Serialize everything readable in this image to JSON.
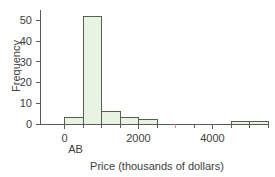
{
  "chart_data": {
    "type": "bar",
    "title": "",
    "subtitle": "",
    "xlabel": "Price (thousands of dollars)",
    "ylabel": "Frequency",
    "xlim": [
      -500,
      5500
    ],
    "ylim": [
      0,
      55
    ],
    "grid": false,
    "legend": null,
    "bin_width": 500,
    "categories": [
      "-500",
      "0",
      "500",
      "1000",
      "1500",
      "2000",
      "2500",
      "3000",
      "3500",
      "4000",
      "4500",
      "5000"
    ],
    "bins": [
      {
        "start": -500,
        "end": 0,
        "value": 0
      },
      {
        "start": 0,
        "end": 500,
        "value": 3
      },
      {
        "start": 500,
        "end": 1000,
        "value": 52
      },
      {
        "start": 1000,
        "end": 1500,
        "value": 6
      },
      {
        "start": 1500,
        "end": 2000,
        "value": 3
      },
      {
        "start": 2000,
        "end": 2500,
        "value": 2
      },
      {
        "start": 2500,
        "end": 3000,
        "value": 0
      },
      {
        "start": 3000,
        "end": 3500,
        "value": 0
      },
      {
        "start": 3500,
        "end": 4000,
        "value": 0
      },
      {
        "start": 4000,
        "end": 4500,
        "value": 0
      },
      {
        "start": 4500,
        "end": 5000,
        "value": 1
      },
      {
        "start": 5000,
        "end": 5500,
        "value": 1
      }
    ],
    "values": [
      0,
      3,
      52,
      6,
      3,
      2,
      0,
      0,
      0,
      0,
      1,
      1
    ],
    "xticks": [
      0,
      2000,
      4000
    ],
    "xtick_labels": [
      "0",
      "2000",
      "4000"
    ],
    "yticks": [
      0,
      10,
      20,
      30,
      40,
      50
    ],
    "ytick_labels": [
      "0",
      "10",
      "20",
      "30",
      "40",
      "50"
    ],
    "annotations": [
      {
        "text": "AB",
        "x": 300,
        "y": -9,
        "name": "ab-annotation"
      }
    ],
    "colors": {
      "bar_fill": "#e9f3e4",
      "bar_edge": "#55614f",
      "axis": "#5a5a5a",
      "text": "#3d3d3d",
      "background": "#ffffff",
      "accent_tick": "#d08f8f"
    }
  }
}
